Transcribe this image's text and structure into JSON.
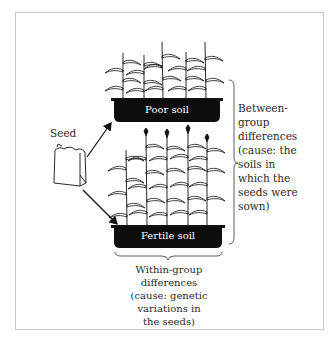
{
  "diagram": {
    "seed_label": "Seed",
    "trays": [
      {
        "id": "poor",
        "label": "Poor soil",
        "plant_count": 5,
        "plant_size": "short"
      },
      {
        "id": "fertile",
        "label": "Fertile soil",
        "plant_count": 5,
        "plant_size": "tall"
      }
    ],
    "between_group": {
      "lines": [
        "Between-",
        "group",
        "differences",
        "(cause: the",
        "soils in",
        "which the",
        "seeds were",
        "sown)"
      ]
    },
    "within_group": {
      "lines": [
        "Within-group differences",
        "(cause: genetic variations in",
        "the seeds)"
      ]
    },
    "colors": {
      "ink": "#111111",
      "tray_fill": "#0d0d0d",
      "tray_text": "#ffffff",
      "frame": "#c8c8c8",
      "background": "#ffffff"
    }
  }
}
